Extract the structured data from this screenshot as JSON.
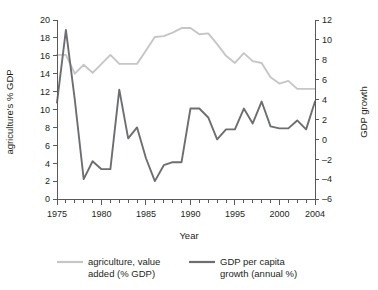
{
  "chart_data": {
    "type": "line",
    "title": "",
    "xlabel": "Year",
    "ylabel": "agriculture's % GDP",
    "y2label": "GDP growth",
    "grid": false,
    "legend_position": "bottom",
    "xlim": [
      1975,
      2004
    ],
    "ylim": [
      0,
      20
    ],
    "y2lim": [
      -6,
      12
    ],
    "x_tick_step": 1,
    "x_labeled_ticks": [
      "1975",
      "1980",
      "1985",
      "1990",
      "1995",
      "2000",
      "2004"
    ],
    "y_ticks": [
      "0",
      "2",
      "4",
      "6",
      "8",
      "10",
      "12",
      "14",
      "16",
      "18",
      "20"
    ],
    "y2_ticks": [
      "-6",
      "-4",
      "-2",
      "0",
      "2",
      "4",
      "6",
      "8",
      "10",
      "12"
    ],
    "x": [
      1975,
      1976,
      1977,
      1978,
      1979,
      1980,
      1981,
      1982,
      1983,
      1984,
      1985,
      1986,
      1987,
      1988,
      1989,
      1990,
      1991,
      1992,
      1993,
      1994,
      1995,
      1996,
      1997,
      1998,
      1999,
      2000,
      2001,
      2002,
      2003,
      2004
    ],
    "series": [
      {
        "name": "agriculture, value added (% GDP)",
        "axis": "left",
        "color": "#c6c6c6",
        "unit": "% GDP",
        "values": [
          16.1,
          16.1,
          14.0,
          15.0,
          14.1,
          15.1,
          16.1,
          15.1,
          15.1,
          15.1,
          16.6,
          18.1,
          18.2,
          18.6,
          19.1,
          19.1,
          18.4,
          18.5,
          17.3,
          16.0,
          15.2,
          16.3,
          15.4,
          15.2,
          13.6,
          12.9,
          13.2,
          12.3,
          12.3,
          12.3
        ]
      },
      {
        "name": "GDP per capita growth (annual %)",
        "axis": "right",
        "color": "#6d6e71",
        "unit": "annual %",
        "values": [
          3.7,
          11.0,
          4.0,
          -4.0,
          -2.2,
          -3.0,
          -3.0,
          5.0,
          0.1,
          1.2,
          -1.9,
          -4.2,
          -2.6,
          -2.3,
          -2.3,
          3.1,
          3.1,
          2.2,
          0.0,
          1.0,
          1.0,
          3.1,
          1.6,
          3.8,
          1.3,
          1.1,
          1.1,
          1.9,
          1.0,
          3.8
        ]
      }
    ]
  },
  "legend": {
    "entries": [
      {
        "label_line1": "agriculture, value",
        "label_line2": "added (% GDP)",
        "color": "#c6c6c6"
      },
      {
        "label_line1": "GDP per capita",
        "label_line2": "growth (annual %)",
        "color": "#6d6e71"
      }
    ]
  }
}
